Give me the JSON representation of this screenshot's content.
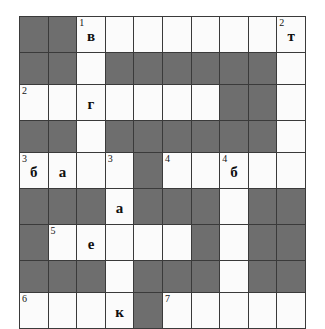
{
  "puzzle": {
    "type": "crossword-grid",
    "rows": 9,
    "columns": 10,
    "colors": {
      "open_cell": "#fbfbfb",
      "block_cell": "#6e6e6e",
      "grid_line": "#3a3a3a",
      "text": "#101010",
      "background": "#ffffff"
    },
    "grid": [
      [
        {
          "state": "block",
          "number": "",
          "letter": ""
        },
        {
          "state": "block",
          "number": "",
          "letter": ""
        },
        {
          "state": "open",
          "number": "1",
          "letter": "в"
        },
        {
          "state": "open",
          "number": "",
          "letter": ""
        },
        {
          "state": "open",
          "number": "",
          "letter": ""
        },
        {
          "state": "open",
          "number": "",
          "letter": ""
        },
        {
          "state": "open",
          "number": "",
          "letter": ""
        },
        {
          "state": "open",
          "number": "",
          "letter": ""
        },
        {
          "state": "open",
          "number": "",
          "letter": ""
        },
        {
          "state": "open",
          "number": "2",
          "letter": "т"
        }
      ],
      [
        {
          "state": "block",
          "number": "",
          "letter": ""
        },
        {
          "state": "block",
          "number": "",
          "letter": ""
        },
        {
          "state": "open",
          "number": "",
          "letter": ""
        },
        {
          "state": "block",
          "number": "",
          "letter": ""
        },
        {
          "state": "block",
          "number": "",
          "letter": ""
        },
        {
          "state": "block",
          "number": "",
          "letter": ""
        },
        {
          "state": "block",
          "number": "",
          "letter": ""
        },
        {
          "state": "block",
          "number": "",
          "letter": ""
        },
        {
          "state": "block",
          "number": "",
          "letter": ""
        },
        {
          "state": "open",
          "number": "",
          "letter": ""
        }
      ],
      [
        {
          "state": "open",
          "number": "2",
          "letter": ""
        },
        {
          "state": "open",
          "number": "",
          "letter": ""
        },
        {
          "state": "open",
          "number": "",
          "letter": "г"
        },
        {
          "state": "open",
          "number": "",
          "letter": ""
        },
        {
          "state": "open",
          "number": "",
          "letter": ""
        },
        {
          "state": "open",
          "number": "",
          "letter": ""
        },
        {
          "state": "open",
          "number": "",
          "letter": ""
        },
        {
          "state": "block",
          "number": "",
          "letter": ""
        },
        {
          "state": "block",
          "number": "",
          "letter": ""
        },
        {
          "state": "open",
          "number": "",
          "letter": ""
        }
      ],
      [
        {
          "state": "block",
          "number": "",
          "letter": ""
        },
        {
          "state": "block",
          "number": "",
          "letter": ""
        },
        {
          "state": "open",
          "number": "",
          "letter": ""
        },
        {
          "state": "block",
          "number": "",
          "letter": ""
        },
        {
          "state": "block",
          "number": "",
          "letter": ""
        },
        {
          "state": "block",
          "number": "",
          "letter": ""
        },
        {
          "state": "block",
          "number": "",
          "letter": ""
        },
        {
          "state": "block",
          "number": "",
          "letter": ""
        },
        {
          "state": "block",
          "number": "",
          "letter": ""
        },
        {
          "state": "open",
          "number": "",
          "letter": ""
        }
      ],
      [
        {
          "state": "open",
          "number": "3",
          "letter": "б"
        },
        {
          "state": "open",
          "number": "",
          "letter": "а"
        },
        {
          "state": "open",
          "number": "",
          "letter": ""
        },
        {
          "state": "open",
          "number": "3",
          "letter": ""
        },
        {
          "state": "block",
          "number": "",
          "letter": ""
        },
        {
          "state": "open",
          "number": "4",
          "letter": ""
        },
        {
          "state": "open",
          "number": "",
          "letter": ""
        },
        {
          "state": "open",
          "number": "4",
          "letter": "б"
        },
        {
          "state": "open",
          "number": "",
          "letter": ""
        },
        {
          "state": "open",
          "number": "",
          "letter": ""
        }
      ],
      [
        {
          "state": "block",
          "number": "",
          "letter": ""
        },
        {
          "state": "block",
          "number": "",
          "letter": ""
        },
        {
          "state": "block",
          "number": "",
          "letter": ""
        },
        {
          "state": "open",
          "number": "",
          "letter": "а"
        },
        {
          "state": "block",
          "number": "",
          "letter": ""
        },
        {
          "state": "block",
          "number": "",
          "letter": ""
        },
        {
          "state": "block",
          "number": "",
          "letter": ""
        },
        {
          "state": "open",
          "number": "",
          "letter": ""
        },
        {
          "state": "block",
          "number": "",
          "letter": ""
        },
        {
          "state": "block",
          "number": "",
          "letter": ""
        }
      ],
      [
        {
          "state": "block",
          "number": "",
          "letter": ""
        },
        {
          "state": "open",
          "number": "5",
          "letter": ""
        },
        {
          "state": "open",
          "number": "",
          "letter": "е"
        },
        {
          "state": "open",
          "number": "",
          "letter": ""
        },
        {
          "state": "open",
          "number": "",
          "letter": ""
        },
        {
          "state": "open",
          "number": "",
          "letter": ""
        },
        {
          "state": "block",
          "number": "",
          "letter": ""
        },
        {
          "state": "open",
          "number": "",
          "letter": ""
        },
        {
          "state": "block",
          "number": "",
          "letter": ""
        },
        {
          "state": "block",
          "number": "",
          "letter": ""
        }
      ],
      [
        {
          "state": "block",
          "number": "",
          "letter": ""
        },
        {
          "state": "block",
          "number": "",
          "letter": ""
        },
        {
          "state": "block",
          "number": "",
          "letter": ""
        },
        {
          "state": "open",
          "number": "",
          "letter": ""
        },
        {
          "state": "block",
          "number": "",
          "letter": ""
        },
        {
          "state": "block",
          "number": "",
          "letter": ""
        },
        {
          "state": "block",
          "number": "",
          "letter": ""
        },
        {
          "state": "open",
          "number": "",
          "letter": ""
        },
        {
          "state": "block",
          "number": "",
          "letter": ""
        },
        {
          "state": "block",
          "number": "",
          "letter": ""
        }
      ],
      [
        {
          "state": "open",
          "number": "6",
          "letter": ""
        },
        {
          "state": "open",
          "number": "",
          "letter": ""
        },
        {
          "state": "open",
          "number": "",
          "letter": ""
        },
        {
          "state": "open",
          "number": "",
          "letter": "к"
        },
        {
          "state": "block",
          "number": "",
          "letter": ""
        },
        {
          "state": "open",
          "number": "7",
          "letter": ""
        },
        {
          "state": "open",
          "number": "",
          "letter": ""
        },
        {
          "state": "open",
          "number": "",
          "letter": ""
        },
        {
          "state": "open",
          "number": "",
          "letter": ""
        },
        {
          "state": "open",
          "number": "",
          "letter": ""
        }
      ]
    ]
  }
}
